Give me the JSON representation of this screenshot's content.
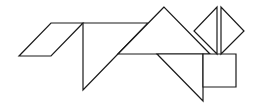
{
  "figure": {
    "type": "tangram",
    "background": "#ffffff",
    "stroke": "#1a1a1a",
    "fill": "#ffffff",
    "pieces": [
      {
        "name": "parallelogram-tail",
        "points": "19,56 51,23 83,23 51,56"
      },
      {
        "name": "large-triangle-body-left",
        "points": "83,23 148,23 83,90"
      },
      {
        "name": "large-triangle-body-right",
        "points": "164,7 118,54 210,54"
      },
      {
        "name": "medium-triangle-leg",
        "points": "157,54 203,54 203,101"
      },
      {
        "name": "square-head",
        "points": "203,54 236,54 236,87 203,87"
      },
      {
        "name": "small-triangle-ear-left",
        "points": "217,7 217,54 194,31"
      },
      {
        "name": "small-triangle-ear-right",
        "points": "221,7 221,54 244,31"
      }
    ]
  }
}
